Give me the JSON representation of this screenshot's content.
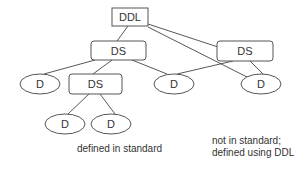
{
  "diagram": {
    "nodes": [
      {
        "id": "ddl",
        "label": "DDL",
        "shape": "rect",
        "x": 112,
        "y": 8,
        "w": 36,
        "h": 18
      },
      {
        "id": "ds_left",
        "label": "DS",
        "shape": "roundrect",
        "x": 91,
        "y": 41,
        "w": 55,
        "h": 19
      },
      {
        "id": "ds_right",
        "label": "DS",
        "shape": "roundrect",
        "x": 217,
        "y": 41,
        "w": 56,
        "h": 20
      },
      {
        "id": "d1",
        "label": "D",
        "shape": "ellipse",
        "cx": 40,
        "cy": 84,
        "rx": 20,
        "ry": 10
      },
      {
        "id": "ds_inner",
        "label": "DS",
        "shape": "roundrect",
        "x": 69,
        "y": 74,
        "w": 53,
        "h": 20
      },
      {
        "id": "d2",
        "label": "D",
        "shape": "ellipse",
        "cx": 174,
        "cy": 84,
        "rx": 20,
        "ry": 10
      },
      {
        "id": "d3",
        "label": "D",
        "shape": "ellipse",
        "cx": 261,
        "cy": 84,
        "rx": 20,
        "ry": 10
      },
      {
        "id": "d4",
        "label": "D",
        "shape": "ellipse",
        "cx": 65,
        "cy": 124,
        "rx": 20,
        "ry": 10
      },
      {
        "id": "d5",
        "label": "D",
        "shape": "ellipse",
        "cx": 111,
        "cy": 124,
        "rx": 20,
        "ry": 10
      }
    ],
    "edges": [
      {
        "from": "ddl",
        "to": "ds_left"
      },
      {
        "from": "ddl",
        "to": "ds_right"
      },
      {
        "from": "ddl",
        "to": "d3"
      },
      {
        "from": "ds_left",
        "to": "d1"
      },
      {
        "from": "ds_left",
        "to": "ds_inner"
      },
      {
        "from": "ds_left",
        "to": "d2"
      },
      {
        "from": "ds_right",
        "to": "d2"
      },
      {
        "from": "ds_right",
        "to": "d3"
      },
      {
        "from": "ds_inner",
        "to": "d4"
      },
      {
        "from": "ds_inner",
        "to": "d5"
      }
    ],
    "captions": {
      "left": "defined in standard",
      "right_line1": "not in standard;",
      "right_line2": "defined using DDL"
    }
  }
}
